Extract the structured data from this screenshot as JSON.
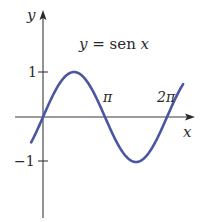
{
  "chart_data": {
    "type": "line",
    "title": "y = sen x",
    "title_parts": {
      "y": "y",
      "eq": " = sen ",
      "x": "x"
    },
    "xlabel": "x",
    "ylabel": "y",
    "function": "sin(x)",
    "x_range": [
      -0.6,
      7.1
    ],
    "ylim": [
      -2.2,
      2.3
    ],
    "x_ticks": [
      {
        "value": 3.14159,
        "label": "π"
      },
      {
        "value": 6.28318,
        "label": "2π"
      }
    ],
    "y_ticks": [
      {
        "value": 1,
        "label": "1"
      },
      {
        "value": -1,
        "label": "−1"
      }
    ],
    "series": [
      {
        "name": "y = sen x",
        "color": "#4a57a0"
      }
    ],
    "grid": false,
    "legend": "none"
  },
  "style": {
    "curve_color": "#4a57a0",
    "axis_color": "#3a3a3a"
  }
}
